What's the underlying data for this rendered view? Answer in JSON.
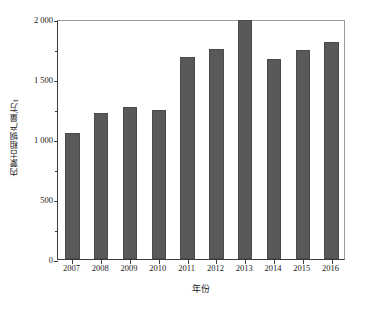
{
  "chart_data": {
    "type": "bar",
    "title": "",
    "xlabel": "年份",
    "ylabel": "内蒙古粗钢产量/万t",
    "categories": [
      "2007",
      "2008",
      "2009",
      "2010",
      "2011",
      "2012",
      "2013",
      "2014",
      "2015",
      "2016"
    ],
    "values": [
      1050,
      1220,
      1270,
      1240,
      1680,
      1750,
      1990,
      1665,
      1740,
      1810
    ],
    "ylim": [
      0,
      2000
    ],
    "xlim_note": "categorical",
    "yticks": [
      0,
      500,
      1000,
      1500,
      2000
    ],
    "ytick_labels": [
      "0",
      "500",
      "1 000",
      "1 500",
      "2 000"
    ],
    "y_minor_ticks": [
      250,
      750,
      1250,
      1750
    ],
    "grid": false,
    "legend": null,
    "legend_position": "none",
    "bar_color": "#595959",
    "axis_color": "#3d3d3d",
    "background_color": "#ffffff",
    "series": [
      {
        "name": "内蒙古粗钢产量",
        "values": [
          1050,
          1220,
          1270,
          1240,
          1680,
          1750,
          1990,
          1665,
          1740,
          1810
        ]
      }
    ],
    "annotations": []
  }
}
